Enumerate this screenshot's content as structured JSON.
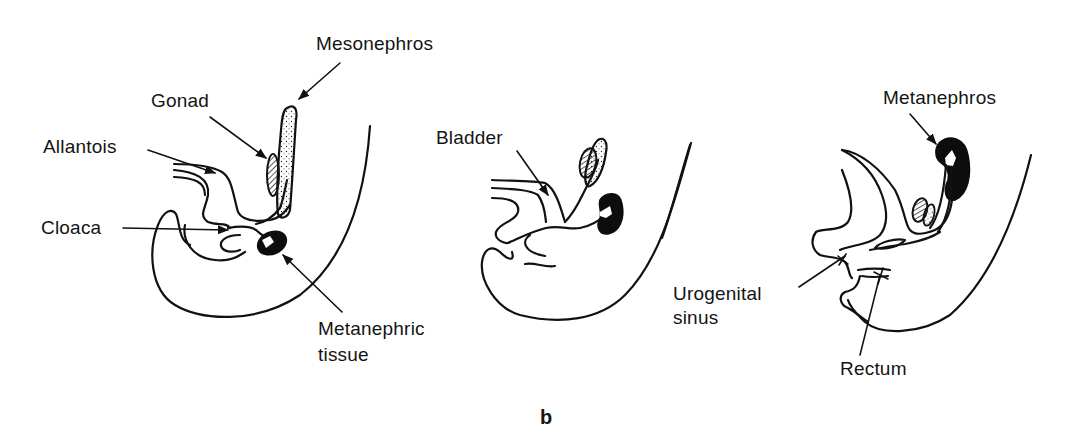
{
  "figure": {
    "caption": "b",
    "panels": [
      {
        "id": "panel-1",
        "labels": {
          "mesonephros": "Mesonephros",
          "gonad": "Gonad",
          "allantois": "Allantois",
          "cloaca": "Cloaca",
          "metanephric_tissue_line1": "Metanephric",
          "metanephric_tissue_line2": "tissue"
        }
      },
      {
        "id": "panel-2",
        "labels": {
          "bladder": "Bladder"
        }
      },
      {
        "id": "panel-3",
        "labels": {
          "metanephros": "Metanephros",
          "urogenital_sinus_line1": "Urogenital",
          "urogenital_sinus_line2": "sinus",
          "rectum": "Rectum"
        }
      }
    ]
  },
  "colors": {
    "background": "#ffffff",
    "ink": "#111111"
  }
}
